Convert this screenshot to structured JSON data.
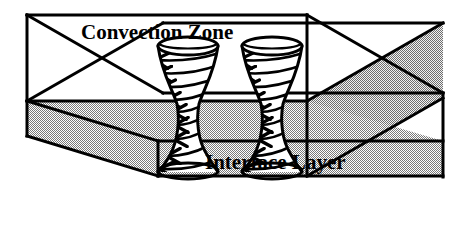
{
  "figure": {
    "kind": "3d-box-schematic",
    "width": 461,
    "height": 229,
    "background_color": "#FFFFFF",
    "line_color": "#000000",
    "fill_upper_color": "#FFFFFF",
    "fill_lower_color": "#B4B4B4",
    "labels": {
      "convection_zone": "Convection Zone",
      "interface_layer": "Interface Layer"
    },
    "label_font_size_px": 21,
    "features": {
      "plume_count": 2,
      "plume_shape": "hourglass-funnel",
      "streamline_style": "spiral-with-arrowheads",
      "arrowheads_per_plume": 8
    }
  },
  "geometry": {
    "front_top_left": [
      27,
      15
    ],
    "front_top_right": [
      307,
      15
    ],
    "front_interface_left": [
      27,
      101
    ],
    "front_interface_right": [
      307,
      101
    ],
    "front_bottom_left": [
      27,
      136
    ],
    "front_bottom_right": [
      307,
      136
    ],
    "depth_dx": 136,
    "depth_dy": 78,
    "slab_front_bottom_left": [
      158,
      176
    ],
    "slab_front_bottom_right": [
      443,
      176
    ],
    "back_top_right": [
      443,
      93
    ],
    "interface_plane_note": "top surface of gray slab"
  },
  "plumes": [
    {
      "name": "plume-left",
      "center_x": 188,
      "top_y": 46,
      "bottom_y": 172,
      "mouth_radius_x": 30,
      "mouth_radius_y": 9,
      "waist_radius_x": 11,
      "base_radius_x": 30,
      "base_radius_y": 8
    },
    {
      "name": "plume-right",
      "center_x": 272,
      "top_y": 46,
      "bottom_y": 172,
      "mouth_radius_x": 30,
      "mouth_radius_y": 9,
      "waist_radius_x": 11,
      "base_radius_x": 30,
      "base_radius_y": 8
    }
  ]
}
